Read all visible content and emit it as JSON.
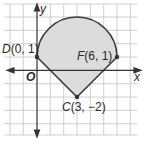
{
  "diagram": {
    "axes": {
      "x_label": "x",
      "y_label": "y",
      "origin_label": "O"
    },
    "points": [
      {
        "name": "D",
        "coords": "(0, 1)",
        "x": 0,
        "y": 1
      },
      {
        "name": "F",
        "coords": "(6, 1)",
        "x": 6,
        "y": 1
      },
      {
        "name": "C",
        "coords": "(3, −2)",
        "x": 3,
        "y": -2
      }
    ],
    "shape": {
      "description": "Region bounded by segments DC and CF and a semicircular arc from D to F centered at (3, 1)",
      "arc_center": [
        3,
        1
      ],
      "arc_radius": 3
    },
    "colors": {
      "fill": "#d9d9d9",
      "stroke": "#3a3a3a",
      "grid": "#bdbdbd"
    }
  }
}
